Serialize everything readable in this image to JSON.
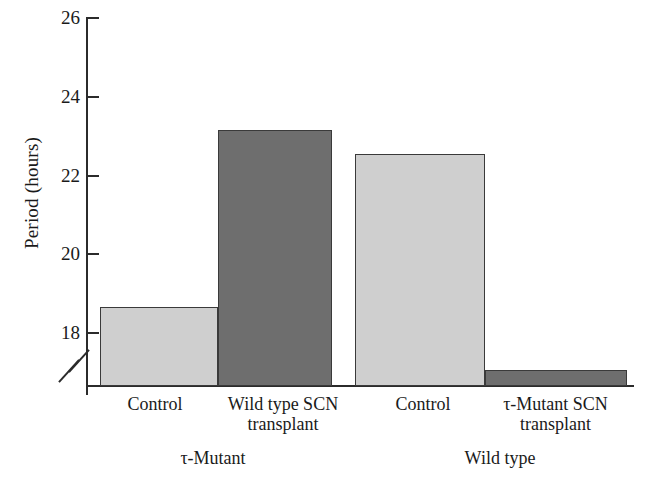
{
  "chart_data": {
    "type": "bar",
    "title": "",
    "xlabel": "",
    "ylabel": "Period (hours)",
    "ylim": [
      17.0,
      26.0
    ],
    "yticks": [
      18,
      20,
      22,
      24,
      26
    ],
    "ytick_labels": [
      "18",
      "20",
      "22",
      "24",
      "26"
    ],
    "axis_break": true,
    "axis_break_note": "y-axis broken below 18",
    "grid": false,
    "legend": false,
    "categories": [
      "Control",
      "Wild type SCN transplant",
      "Control",
      "τ-Mutant SCN transplant"
    ],
    "values": [
      19.0,
      23.5,
      22.9,
      17.4
    ],
    "bar_colors": [
      "#cfcfcf",
      "#6e6e6e",
      "#cfcfcf",
      "#6e6e6e"
    ],
    "groups": [
      {
        "label": "τ-Mutant",
        "bars": [
          {
            "label_line1": "Control",
            "label_line2": "",
            "value": 19.0,
            "shade": "light"
          },
          {
            "label_line1": "Wild type SCN",
            "label_line2": "transplant",
            "value": 23.5,
            "shade": "dark"
          }
        ]
      },
      {
        "label": "Wild type",
        "bars": [
          {
            "label_line1": "Control",
            "label_line2": "",
            "value": 22.9,
            "shade": "light"
          },
          {
            "label_line1": "τ-Mutant SCN",
            "label_line2": "transplant",
            "value": 17.4,
            "shade": "dark"
          }
        ]
      }
    ]
  },
  "axis": {
    "ylabel": "Period (hours)",
    "ticks": [
      {
        "label": "26",
        "value": 26
      },
      {
        "label": "24",
        "value": 24
      },
      {
        "label": "22",
        "value": 22
      },
      {
        "label": "20",
        "value": 20
      },
      {
        "label": "18",
        "value": 18
      }
    ]
  },
  "labels": {
    "bar1_line1": "Control",
    "bar1_line2": "",
    "bar2_line1": "Wild type SCN",
    "bar2_line2": "transplant",
    "bar3_line1": "Control",
    "bar3_line2": "",
    "bar4_line1": "τ-Mutant SCN",
    "bar4_line2": "transplant",
    "group1": "τ-Mutant",
    "group2": "Wild type"
  }
}
